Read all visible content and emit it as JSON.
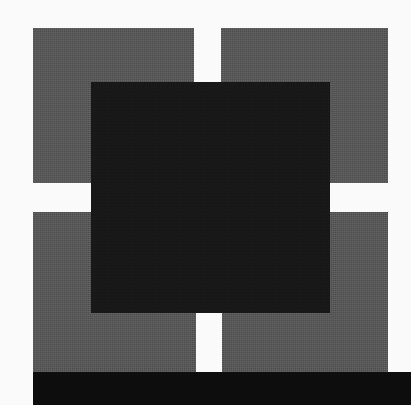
{
  "composition": {
    "title": "Abstract geometric composition",
    "width": 411,
    "height": 405,
    "background_color": "#fafafa",
    "description": "Two-by-two grid of gray squares separated by white gutters, with a large dark square overlaid across the center, and a solid black horizontal bar along the bottom edge.",
    "palette": {
      "background": "#fafafa",
      "gray": "#585858",
      "black_square": "#181818",
      "black_bar": "#0d0d0d"
    },
    "texture": "halftone-dither-grain"
  },
  "shapes": [
    {
      "name": "gray-square-top-left",
      "fill": "#585858",
      "x": 33,
      "y": 28,
      "width": 161,
      "height": 155
    },
    {
      "name": "gray-square-top-right",
      "fill": "#585858",
      "x": 221,
      "y": 28,
      "width": 167,
      "height": 155
    },
    {
      "name": "gray-square-bottom-left",
      "fill": "#585858",
      "x": 33,
      "y": 212,
      "width": 163,
      "height": 160
    },
    {
      "name": "gray-square-bottom-right",
      "fill": "#585858",
      "x": 222,
      "y": 212,
      "width": 166,
      "height": 160
    },
    {
      "name": "black-square-center",
      "fill": "#181818",
      "x": 91,
      "y": 82,
      "width": 239,
      "height": 231
    },
    {
      "name": "black-bar-bottom",
      "fill": "#0d0d0d",
      "x": 33,
      "y": 372,
      "width": 378,
      "height": 33
    }
  ]
}
